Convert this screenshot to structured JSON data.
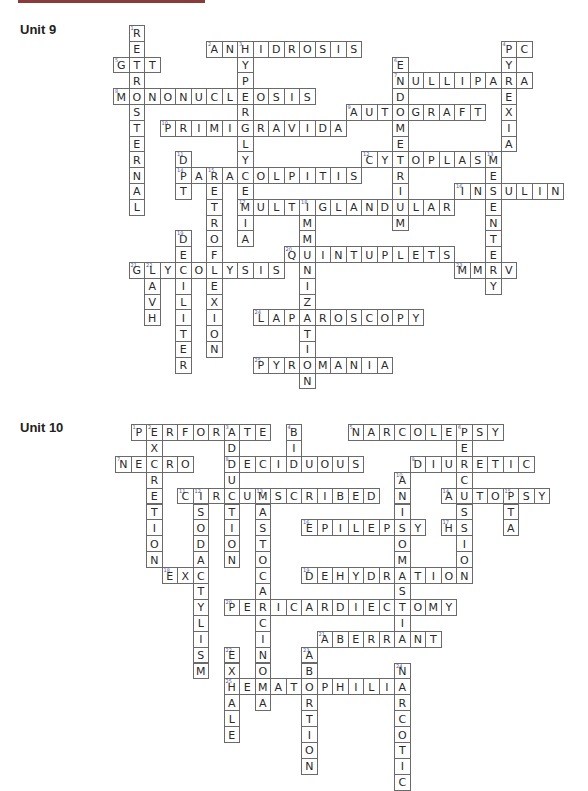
{
  "page": {
    "accent_bar_color": "#8b3a3a"
  },
  "units": [
    {
      "label": "Unit 9",
      "label_top": 22,
      "origin": {
        "x": 113,
        "y": 25
      },
      "cell": {
        "w": 15.5,
        "h": 15.8
      },
      "words": [
        {
          "num": 1,
          "answer": "RETROSTERNAL",
          "dir": "down",
          "row": 0,
          "col": 1
        },
        {
          "num": 2,
          "answer": "ANHIDROSIS",
          "dir": "across",
          "row": 1,
          "col": 6
        },
        {
          "num": 3,
          "answer": "HYPERGLYCEMIA",
          "dir": "down",
          "row": 1,
          "col": 8
        },
        {
          "num": 4,
          "answer": "PC",
          "dir": "across",
          "row": 1,
          "col": 25
        },
        {
          "num": 4,
          "answer": "PYREXIA",
          "dir": "down",
          "row": 1,
          "col": 25
        },
        {
          "num": 5,
          "answer": "GTT",
          "dir": "across",
          "row": 2,
          "col": 0
        },
        {
          "num": 6,
          "answer": "ENDOMETRIUM",
          "dir": "down",
          "row": 2,
          "col": 18
        },
        {
          "num": 7,
          "answer": "NULLIPARA",
          "dir": "across",
          "row": 3,
          "col": 18
        },
        {
          "num": 8,
          "answer": "MONONUCLEOSIS",
          "dir": "across",
          "row": 4,
          "col": 0
        },
        {
          "num": 9,
          "answer": "AUTOGRAFT",
          "dir": "across",
          "row": 5,
          "col": 15
        },
        {
          "num": 10,
          "answer": "PRIMIGRAVIDA",
          "dir": "across",
          "row": 6,
          "col": 3
        },
        {
          "num": 11,
          "answer": "DPT",
          "dir": "down",
          "row": 8,
          "col": 4
        },
        {
          "num": 12,
          "answer": "CYTOPLASM",
          "dir": "across",
          "row": 8,
          "col": 16
        },
        {
          "num": 13,
          "answer": "MESENTERY",
          "dir": "down",
          "row": 8,
          "col": 24
        },
        {
          "num": 14,
          "answer": "PARACOLPITIS",
          "dir": "across",
          "row": 9,
          "col": 4
        },
        {
          "num": 15,
          "answer": "RETROFLEXION",
          "dir": "down",
          "row": 9,
          "col": 6
        },
        {
          "num": 16,
          "answer": "INSULIN",
          "dir": "across",
          "row": 10,
          "col": 22
        },
        {
          "num": 17,
          "answer": "MULTIGLANDULAR",
          "dir": "across",
          "row": 11,
          "col": 8
        },
        {
          "num": 18,
          "answer": "IMMUNIZATION",
          "dir": "down",
          "row": 11,
          "col": 12
        },
        {
          "num": 19,
          "answer": "DECILITER",
          "dir": "down",
          "row": 13,
          "col": 4
        },
        {
          "num": 20,
          "answer": "QUINTUPLETS",
          "dir": "across",
          "row": 14,
          "col": 11
        },
        {
          "num": 21,
          "answer": "GLYCOLYSIS",
          "dir": "across",
          "row": 15,
          "col": 1
        },
        {
          "num": 22,
          "answer": "LAVH",
          "dir": "down",
          "row": 15,
          "col": 2
        },
        {
          "num": 23,
          "answer": "MMRV",
          "dir": "across",
          "row": 15,
          "col": 22
        },
        {
          "num": 24,
          "answer": "LAPAROSCOPY",
          "dir": "across",
          "row": 18,
          "col": 9
        },
        {
          "num": 25,
          "answer": "PYROMANIA",
          "dir": "across",
          "row": 21,
          "col": 9
        }
      ]
    },
    {
      "label": "Unit 10",
      "label_top": 420,
      "origin": {
        "x": 115,
        "y": 424
      },
      "cell": {
        "w": 15.5,
        "h": 15.9
      },
      "words": [
        {
          "num": 1,
          "answer": "PERFORATE",
          "dir": "across",
          "row": 0,
          "col": 1
        },
        {
          "num": 2,
          "answer": "EXCRETION",
          "dir": "down",
          "row": 0,
          "col": 2
        },
        {
          "num": 3,
          "answer": "ADDUCTION",
          "dir": "down",
          "row": 0,
          "col": 7
        },
        {
          "num": 4,
          "answer": "BID",
          "dir": "down",
          "row": 0,
          "col": 11
        },
        {
          "num": 5,
          "answer": "NARCOLEPSY",
          "dir": "across",
          "row": 0,
          "col": 15
        },
        {
          "num": 6,
          "answer": "PERCUSSION",
          "dir": "down",
          "row": 0,
          "col": 22
        },
        {
          "num": 7,
          "answer": "NECRO",
          "dir": "across",
          "row": 2,
          "col": 0
        },
        {
          "num": 8,
          "answer": "DECIDUOUS",
          "dir": "across",
          "row": 2,
          "col": 7
        },
        {
          "num": 9,
          "answer": "DIURETIC",
          "dir": "across",
          "row": 2,
          "col": 19
        },
        {
          "num": 10,
          "answer": "ANISOMASTIA",
          "dir": "down",
          "row": 3,
          "col": 18
        },
        {
          "num": 11,
          "answer": "CIRCUMSCRIBED",
          "dir": "across",
          "row": 4,
          "col": 4
        },
        {
          "num": 12,
          "answer": "ISODACTYLISM",
          "dir": "down",
          "row": 4,
          "col": 5
        },
        {
          "num": 13,
          "answer": "MASTOCARCINOMA",
          "dir": "down",
          "row": 4,
          "col": 9
        },
        {
          "num": 14,
          "answer": "AUTOPSY",
          "dir": "across",
          "row": 4,
          "col": 21
        },
        {
          "num": 15,
          "answer": "PTA",
          "dir": "down",
          "row": 4,
          "col": 25
        },
        {
          "num": 16,
          "answer": "EPILEPSY",
          "dir": "across",
          "row": 6,
          "col": 12
        },
        {
          "num": 17,
          "answer": "HS",
          "dir": "across",
          "row": 6,
          "col": 21
        },
        {
          "num": 18,
          "answer": "EXC",
          "dir": "across",
          "row": 9,
          "col": 3
        },
        {
          "num": 19,
          "answer": "DEHYDRATION",
          "dir": "across",
          "row": 9,
          "col": 12
        },
        {
          "num": 20,
          "answer": "PERICARDIECTOMY",
          "dir": "across",
          "row": 11,
          "col": 7
        },
        {
          "num": 21,
          "answer": "ABERRANT",
          "dir": "across",
          "row": 13,
          "col": 13
        },
        {
          "num": 22,
          "answer": "EXHALE",
          "dir": "down",
          "row": 14,
          "col": 7
        },
        {
          "num": 23,
          "answer": "ABORTION",
          "dir": "down",
          "row": 14,
          "col": 12
        },
        {
          "num": 24,
          "answer": "NARCOTIC",
          "dir": "down",
          "row": 15,
          "col": 18
        },
        {
          "num": 25,
          "answer": "HEMATOPHILIA",
          "dir": "across",
          "row": 16,
          "col": 7
        }
      ]
    }
  ]
}
